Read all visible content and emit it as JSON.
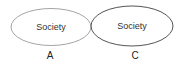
{
  "diagram": {
    "nodes": [
      {
        "id": "A",
        "text": "Society",
        "caption": "A",
        "stroke": "#9a9a9a",
        "cx": 51,
        "cy": 27,
        "rx": 40,
        "ry": 18.5
      },
      {
        "id": "C",
        "text": "Society",
        "caption": "C",
        "stroke": "#555555",
        "cx": 132,
        "cy": 26,
        "rx": 41,
        "ry": 20
      }
    ]
  }
}
